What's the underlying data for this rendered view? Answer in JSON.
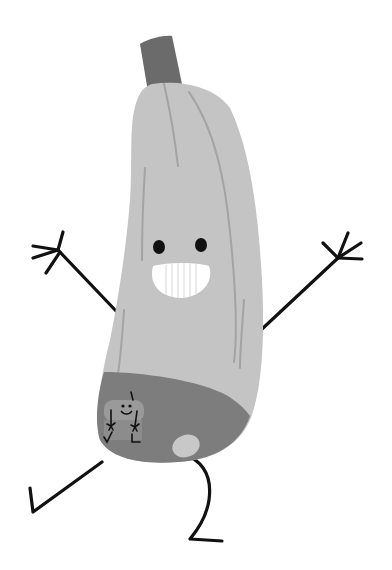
{
  "illustration": {
    "subject": "cartoon zucchini character dancing",
    "colors": {
      "background": "#ffffff",
      "body": "#c4c4c4",
      "body_line": "#a3a3a3",
      "stem": "#6b6b6b",
      "underpants": "#7d7d7d",
      "underpants_hole": "#c8c8c8",
      "limb": "#111111",
      "eye": "#111111",
      "teeth": "#ffffff",
      "tooth_line": "#d6d6d6",
      "print_head": "#9a9a9a",
      "print_body": "#8c8c8c"
    }
  }
}
